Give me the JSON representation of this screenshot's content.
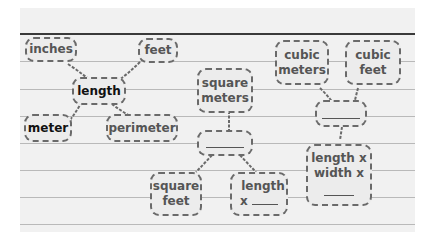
{
  "diagram": {
    "web_length": {
      "center": "length",
      "branches": [
        "inches",
        "feet",
        "meter",
        "perimeter"
      ]
    },
    "web_area": {
      "top": "square meters",
      "center_blank": "________",
      "branches": [
        "square feet",
        "length x ____"
      ]
    },
    "web_volume": {
      "top": [
        "cubic meters",
        "cubic feet"
      ],
      "center_blank": "________",
      "bottom": "length x width x ____"
    }
  },
  "labels": {
    "inches": "inches",
    "feet": "feet",
    "length": "length",
    "meter": "meter",
    "perimeter": "perimeter",
    "square_meters_1": "square",
    "square_meters_2": "meters",
    "square_feet_1": "square",
    "square_feet_2": "feet",
    "length_x_1": "length",
    "length_x_2": "x",
    "cubic_meters_1": "cubic",
    "cubic_meters_2": "meters",
    "cubic_feet_1": "cubic",
    "cubic_feet_2": "feet",
    "lwx_1": "length x",
    "lwx_2": "width x"
  },
  "colors": {
    "paper": "#f1f1f1",
    "border": "#6a6a6a",
    "rule": "#b9b9b9",
    "topline": "#3a3a3a"
  }
}
